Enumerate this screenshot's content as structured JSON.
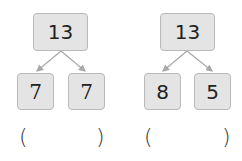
{
  "diagrams": [
    {
      "parent": "13",
      "children": [
        "7",
        "7"
      ],
      "answer": {
        "open": "(",
        "close": ")",
        "value": ""
      }
    },
    {
      "parent": "13",
      "children": [
        "8",
        "5"
      ],
      "answer": {
        "open": "(",
        "close": ")",
        "value": ""
      }
    }
  ],
  "colors": {
    "box_fill": "#e4e4e4",
    "box_border": "#b9b9b9",
    "arrow": "#a8a8a8"
  }
}
